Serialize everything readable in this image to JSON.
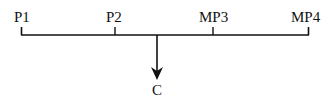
{
  "diagram": {
    "nodes": [
      {
        "id": "P1",
        "label": "P1",
        "x": 21
      },
      {
        "id": "P2",
        "label": "P2",
        "x": 115
      },
      {
        "id": "MP3",
        "label": "MP3",
        "x": 213
      },
      {
        "id": "MP4",
        "label": "MP4",
        "x": 308
      }
    ],
    "output": {
      "id": "C",
      "label": "C",
      "x": 157
    },
    "colors": {
      "stroke": "#111111",
      "background": "#ffffff"
    }
  }
}
